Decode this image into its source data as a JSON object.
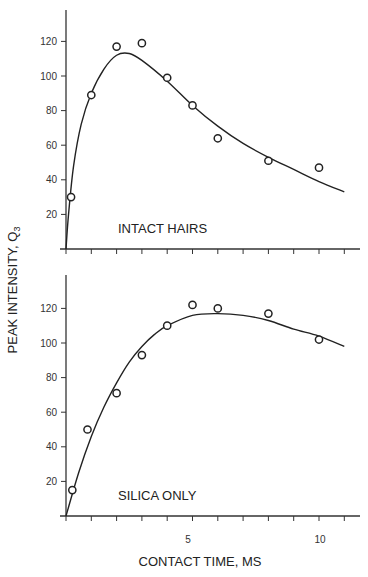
{
  "chart_data": [
    {
      "type": "scatter",
      "panel": "top",
      "annotation": "INTACT HAIRS",
      "xlabel": "CONTACT TIME, MS",
      "ylabel": "PEAK INTENSITY, Q3",
      "xlim": [
        0,
        11.5
      ],
      "ylim": [
        0,
        135
      ],
      "yticks": [
        20,
        40,
        60,
        80,
        100,
        120
      ],
      "xticks": [
        0,
        1,
        2,
        3,
        4,
        5,
        6,
        7,
        8,
        9,
        10,
        11
      ],
      "grid": false,
      "series": [
        {
          "name": "data points",
          "marker": "open-circle",
          "x": [
            0.2,
            1,
            2,
            3,
            4,
            5,
            6,
            8,
            10
          ],
          "y": [
            30,
            89,
            117,
            119,
            99,
            83,
            64,
            51,
            47
          ]
        },
        {
          "name": "fitted curve",
          "style": "line",
          "x": [
            0,
            0.1,
            0.3,
            0.6,
            1,
            1.5,
            2,
            2.5,
            3,
            4,
            5,
            6,
            7,
            8,
            9,
            10,
            11
          ],
          "y": [
            0,
            20,
            48,
            72,
            90,
            104,
            112,
            113,
            109,
            97,
            83,
            71,
            61,
            53,
            46,
            39,
            33
          ]
        }
      ]
    },
    {
      "type": "scatter",
      "panel": "bottom",
      "annotation": "SILICA ONLY",
      "xlabel": "CONTACT TIME, MS",
      "ylabel": "PEAK INTENSITY, Q3",
      "xlim": [
        0,
        11.5
      ],
      "ylim": [
        0,
        135
      ],
      "yticks": [
        20,
        40,
        60,
        80,
        100,
        120
      ],
      "xticks": [
        0,
        1,
        2,
        3,
        4,
        5,
        6,
        7,
        8,
        9,
        10,
        11
      ],
      "xticklabels": {
        "5": "5",
        "10": "10"
      },
      "grid": false,
      "series": [
        {
          "name": "data points",
          "marker": "open-circle",
          "x": [
            0.25,
            0.85,
            2,
            3,
            4,
            5,
            6,
            8,
            10
          ],
          "y": [
            15,
            50,
            71,
            93,
            110,
            122,
            120,
            117,
            102
          ]
        },
        {
          "name": "fitted curve",
          "style": "line",
          "x": [
            0,
            0.5,
            1,
            1.5,
            2,
            2.5,
            3,
            3.5,
            4,
            5,
            6,
            7,
            8,
            9,
            10,
            11
          ],
          "y": [
            0,
            25,
            46,
            63,
            77,
            89,
            98,
            105,
            110,
            116,
            117,
            116,
            113,
            108,
            104,
            98
          ]
        }
      ]
    }
  ],
  "labels": {
    "top_annotation": "INTACT HAIRS",
    "bottom_annotation": "SILICA ONLY",
    "x_axis_title": "CONTACT TIME, MS",
    "y_axis_title": "PEAK INTENSITY, Q",
    "y_axis_subscript": "3",
    "ytick_labels": [
      "20",
      "40",
      "60",
      "80",
      "100",
      "120"
    ],
    "xtick_5": "5",
    "xtick_10": "10"
  }
}
